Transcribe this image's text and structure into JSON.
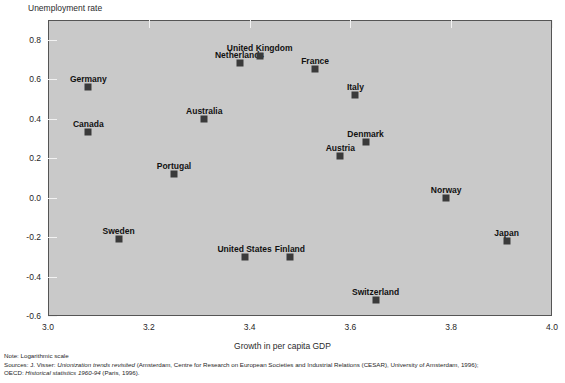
{
  "chart_data": {
    "type": "scatter",
    "title": "",
    "ylabel": "Unemployment rate",
    "xlabel": "Growth in per capita GDP",
    "xlim": [
      3.0,
      4.0
    ],
    "ylim": [
      -0.6,
      0.9
    ],
    "xticks": [
      "3.0",
      "3.2",
      "3.4",
      "3.6",
      "3.8",
      "4.0"
    ],
    "xtick_values": [
      3.0,
      3.2,
      3.4,
      3.6,
      3.8,
      4.0
    ],
    "yticks": [
      "0.8",
      "0.6",
      "0.4",
      "0.2",
      "0.0",
      "-0.2",
      "-0.4",
      "-0.6"
    ],
    "ytick_values": [
      0.8,
      0.6,
      0.4,
      0.2,
      0.0,
      -0.2,
      -0.4,
      -0.6
    ],
    "grid": false,
    "legend": "none",
    "marker": "square",
    "marker_color": "#3a3a3a",
    "plot_background": "#c9c9c9",
    "points": [
      {
        "label": "Germany",
        "x": 3.08,
        "y": 0.56,
        "label_dx": 0,
        "label_dy": -13
      },
      {
        "label": "Canada",
        "x": 3.08,
        "y": 0.33,
        "label_dx": 0,
        "label_dy": -13
      },
      {
        "label": "Sweden",
        "x": 3.14,
        "y": -0.21,
        "label_dx": 0,
        "label_dy": -13
      },
      {
        "label": "Portugal",
        "x": 3.25,
        "y": 0.12,
        "label_dx": 0,
        "label_dy": -13
      },
      {
        "label": "Australia",
        "x": 3.31,
        "y": 0.4,
        "label_dx": 0,
        "label_dy": -13
      },
      {
        "label": "Netherlands",
        "x": 3.38,
        "y": 0.68,
        "label_dx": 0,
        "label_dy": -13
      },
      {
        "label": "United States",
        "x": 3.39,
        "y": -0.3,
        "label_dx": 0,
        "label_dy": -13
      },
      {
        "label": "United Kingdom",
        "x": 3.42,
        "y": 0.72,
        "label_dx": 0,
        "label_dy": -13
      },
      {
        "label": "Finland",
        "x": 3.48,
        "y": -0.3,
        "label_dx": 0,
        "label_dy": -13
      },
      {
        "label": "Austria",
        "x": 3.58,
        "y": 0.21,
        "label_dx": 0,
        "label_dy": -13
      },
      {
        "label": "France",
        "x": 3.53,
        "y": 0.65,
        "label_dx": 0,
        "label_dy": -13
      },
      {
        "label": "Switzerland",
        "x": 3.65,
        "y": -0.52,
        "label_dx": 0,
        "label_dy": -13
      },
      {
        "label": "Denmark",
        "x": 3.63,
        "y": 0.28,
        "label_dx": 0,
        "label_dy": -13
      },
      {
        "label": "Italy",
        "x": 3.61,
        "y": 0.52,
        "label_dx": 0,
        "label_dy": -13
      },
      {
        "label": "Norway",
        "x": 3.79,
        "y": 0.0,
        "label_dx": 0,
        "label_dy": -13
      },
      {
        "label": "Japan",
        "x": 3.91,
        "y": -0.22,
        "label_dx": 0,
        "label_dy": -13
      }
    ]
  },
  "footnotes": {
    "note": "Note: Logarithmic scale",
    "sources_line1_prefix": "Sources: J. Visser: ",
    "sources_line1_italic": "Unionization trends revisited",
    "sources_line1_suffix": " (Amsterdam, Centre for Research on European Societies and Industrial Relations (CESAR), University of Amsterdam, 1996);",
    "sources_line2_prefix": "OECD: ",
    "sources_line2_italic": "Historical statistics 1960-94",
    "sources_line2_suffix": " (Paris, 1996)."
  }
}
